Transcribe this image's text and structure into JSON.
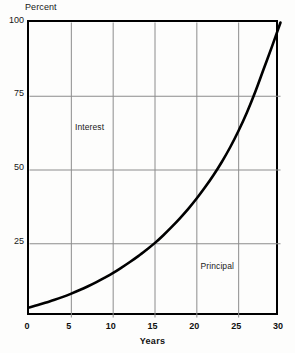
{
  "figure": {
    "background_color": "#fdfdfc",
    "ink_color": "#000000",
    "grid_color": "#8c8c8c"
  },
  "chart_data": {
    "type": "area",
    "title": "",
    "subtitle": "",
    "xlabel": "Years",
    "ylabel": "Percent",
    "xlim": [
      0,
      30
    ],
    "ylim": [
      0,
      100
    ],
    "grid": true,
    "legend_position": "inside-plot-annotations",
    "x_ticks": [
      0,
      5,
      10,
      15,
      20,
      25,
      30
    ],
    "x_tick_labels": [
      "0",
      "5",
      "10",
      "15",
      "20",
      "25",
      "30"
    ],
    "y_ticks": [
      25,
      50,
      75,
      100
    ],
    "y_tick_labels": [
      "25",
      "50",
      "75",
      "100"
    ],
    "y_axis_top_label": "100",
    "annotations": [
      {
        "text": "Interest",
        "x": 5.5,
        "y": 66
      },
      {
        "text": "Principal",
        "x": 20.5,
        "y": 19
      }
    ],
    "series": [
      {
        "name": "Principal",
        "description": "Cumulative share of payment applied to principal, rising exponentially to 100% at year 30",
        "x": [
          0,
          1,
          2,
          3,
          4,
          5,
          6,
          7,
          8,
          9,
          10,
          11,
          12,
          13,
          14,
          15,
          16,
          17,
          18,
          19,
          20,
          21,
          22,
          23,
          24,
          25,
          26,
          27,
          28,
          29,
          30
        ],
        "values": [
          3.4,
          4.2,
          5.1,
          6.0,
          7.0,
          8.1,
          9.3,
          10.6,
          12.0,
          13.5,
          15.1,
          16.9,
          18.8,
          20.8,
          23.0,
          25.3,
          27.9,
          30.7,
          33.7,
          36.9,
          40.4,
          44.2,
          48.3,
          52.8,
          57.8,
          63.4,
          69.6,
          76.6,
          84.3,
          92.0,
          100.0
        ]
      }
    ],
    "reference_points": [
      {
        "x": 0,
        "y": 3.4
      },
      {
        "x": 15,
        "y": 25
      },
      {
        "x": 23,
        "y": 50
      },
      {
        "x": 27,
        "y": 75
      },
      {
        "x": 30,
        "y": 100
      }
    ]
  },
  "labels": {
    "y_axis_title": "Percent",
    "x_axis_title": "Years",
    "interest_region": "Interest",
    "principal_region": "Principal"
  }
}
